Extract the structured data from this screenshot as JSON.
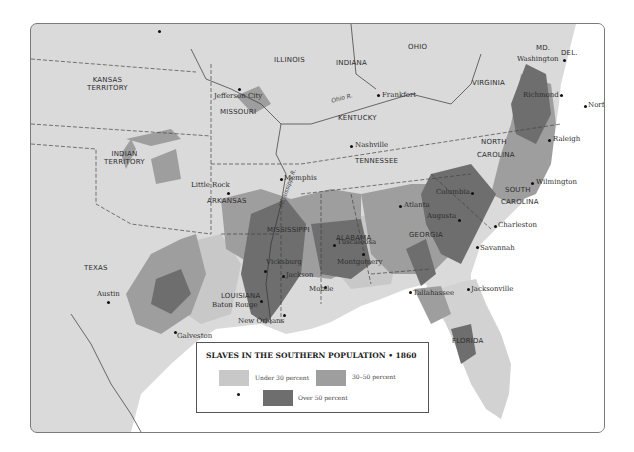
{
  "legend": {
    "title": "SLAVES IN THE SOUTHERN POPULATION • 1860",
    "items": [
      {
        "label": "Under 30 percent",
        "color": "#c8c8c8"
      },
      {
        "label": "30–50 percent",
        "color": "#9e9e9e"
      },
      {
        "label": "Over 50 percent",
        "color": "#6e6e6e"
      }
    ]
  },
  "colors": {
    "land": "#dadada",
    "water": "#ffffff",
    "under30": "#c8c8c8",
    "mid": "#9e9e9e",
    "over50": "#6e6e6e",
    "border": "#444444"
  },
  "states": [
    {
      "name": "KANSAS",
      "line2": "TERRITORY"
    },
    {
      "name": "INDIAN",
      "line2": "TERRITORY"
    },
    {
      "name": "MISSOURI"
    },
    {
      "name": "ILLINOIS"
    },
    {
      "name": "INDIANA"
    },
    {
      "name": "OHIO"
    },
    {
      "name": "KENTUCKY"
    },
    {
      "name": "VIRGINIA"
    },
    {
      "name": "MD."
    },
    {
      "name": "DEL."
    },
    {
      "name": "NORTH",
      "line2": "CAROLINA"
    },
    {
      "name": "TENNESSEE"
    },
    {
      "name": "ARKANSAS"
    },
    {
      "name": "SOUTH",
      "line2": "CAROLINA"
    },
    {
      "name": "MISSISSIPPI"
    },
    {
      "name": "ALABAMA"
    },
    {
      "name": "GEORGIA"
    },
    {
      "name": "TEXAS"
    },
    {
      "name": "LOUISIANA"
    },
    {
      "name": "FLORIDA"
    }
  ],
  "cities": [
    "Jefferson City",
    "Frankfort",
    "Washington",
    "Richmond",
    "Norfolk",
    "Raleigh",
    "Nashville",
    "Memphis",
    "Little Rock",
    "Wilmington",
    "Columbia",
    "Atlanta",
    "Tuscaloosa",
    "Augusta",
    "Charleston",
    "Vicksburg",
    "Jackson",
    "Montgomery",
    "Savannah",
    "Austin",
    "Baton Rouge",
    "Mobile",
    "Tallahassee",
    "Jacksonville",
    "New Orleans",
    "Galveston"
  ],
  "rivers": [
    "Ohio R.",
    "Mississippi R."
  ]
}
